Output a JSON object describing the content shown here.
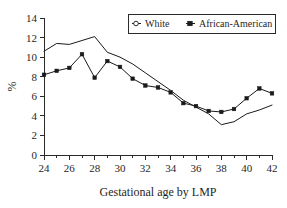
{
  "chart_data": {
    "type": "line",
    "title": "",
    "xlabel": "Gestational age by LMP",
    "ylabel": "%",
    "x": [
      24,
      25,
      26,
      27,
      28,
      29,
      30,
      31,
      32,
      33,
      34,
      35,
      36,
      37,
      38,
      39,
      40,
      41,
      42
    ],
    "xlim": [
      24,
      42
    ],
    "ylim": [
      0,
      14
    ],
    "xticks": [
      24,
      26,
      28,
      30,
      32,
      34,
      36,
      38,
      40,
      42
    ],
    "xtick_labels": [
      "24",
      "26",
      "28",
      "30",
      "32",
      "34",
      "36",
      "38",
      "40",
      "42"
    ],
    "xticks_minor": [
      25,
      27,
      29,
      31,
      33,
      35,
      37,
      39,
      41
    ],
    "yticks": [
      0,
      2,
      4,
      6,
      8,
      10,
      12,
      14
    ],
    "ytick_labels": [
      "0",
      "2",
      "4",
      "6",
      "8",
      "10",
      "12",
      "14"
    ],
    "grid": false,
    "legend_position": "top-right",
    "series": [
      {
        "name": "White",
        "marker": "open-circle",
        "color": "#1a1a1a",
        "values": [
          10.6,
          11.4,
          11.3,
          11.7,
          12.1,
          10.5,
          10.0,
          9.3,
          8.4,
          7.5,
          6.6,
          5.6,
          4.9,
          4.2,
          3.1,
          3.4,
          4.2,
          4.6,
          5.1
        ]
      },
      {
        "name": "African-American",
        "marker": "filled-square",
        "color": "#1a1a1a",
        "values": [
          8.2,
          8.6,
          8.9,
          10.3,
          7.9,
          9.6,
          9.0,
          7.8,
          7.1,
          6.9,
          6.4,
          5.3,
          5.0,
          4.5,
          4.4,
          4.7,
          5.8,
          6.8,
          6.3
        ]
      }
    ]
  },
  "legend": {
    "entries": [
      {
        "label": "White",
        "marker": "open-circle"
      },
      {
        "label": "African-American",
        "marker": "filled-square"
      }
    ]
  },
  "axes": {
    "x_title": "Gestational age by LMP",
    "y_title": "%"
  }
}
